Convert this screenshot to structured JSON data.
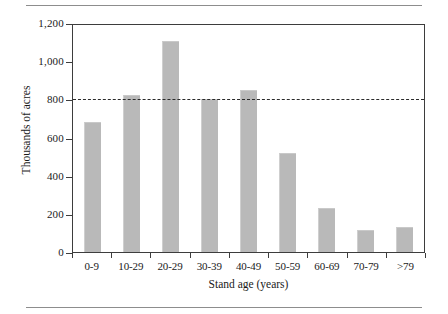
{
  "figure": {
    "has_top_rule": true,
    "has_bottom_rule": true,
    "rule_color": "#8d8d8d"
  },
  "chart_data": {
    "type": "bar",
    "title": "",
    "subtitle": "",
    "xlabel": "Stand age (years)",
    "ylabel": "Thousands of acres",
    "categories": [
      "0-9",
      "10-29",
      "20-29",
      "30-39",
      "40-49",
      "50-59",
      "60-69",
      "70-79",
      ">79"
    ],
    "values": [
      680,
      825,
      1108,
      800,
      848,
      520,
      233,
      115,
      133
    ],
    "series": [
      {
        "name": "Thousands of acres",
        "values": [
          680,
          825,
          1108,
          800,
          848,
          520,
          233,
          115,
          133
        ]
      }
    ],
    "ylim": [
      0,
      1200
    ],
    "yticks": [
      0,
      200,
      400,
      600,
      800,
      1000,
      1200
    ],
    "ytick_labels": [
      "0",
      "200",
      "400",
      "600",
      "800",
      "1,000",
      "1,200"
    ],
    "grid": false,
    "legend": "none",
    "bar_color": "#b9b9b9",
    "axis_color": "#3d3d3d",
    "annotations": [
      {
        "type": "reference-line",
        "orientation": "horizontal",
        "value": 810,
        "style": "dashed",
        "color": "#2b2b2b",
        "label": ""
      }
    ]
  }
}
